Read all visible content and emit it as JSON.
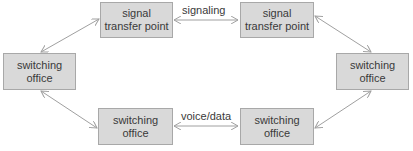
{
  "diagram": {
    "nodes": [
      {
        "id": "stp_left",
        "line1": "signal",
        "line2": "transfer point"
      },
      {
        "id": "stp_right",
        "line1": "signal",
        "line2": "transfer point"
      },
      {
        "id": "so_left",
        "line1": "switching",
        "line2": "office"
      },
      {
        "id": "so_right",
        "line1": "switching",
        "line2": "office"
      },
      {
        "id": "so_bottom_left",
        "line1": "switching",
        "line2": "office"
      },
      {
        "id": "so_bottom_right",
        "line1": "switching",
        "line2": "office"
      }
    ],
    "edges": [
      {
        "from": "stp_left",
        "to": "stp_right",
        "label": "signaling",
        "direction": "both"
      },
      {
        "from": "so_bottom_left",
        "to": "so_bottom_right",
        "label": "voice/data",
        "direction": "both"
      },
      {
        "from": "stp_left",
        "to": "so_left",
        "label": "",
        "direction": "both"
      },
      {
        "from": "stp_right",
        "to": "so_right",
        "label": "",
        "direction": "both"
      },
      {
        "from": "so_left",
        "to": "so_bottom_left",
        "label": "",
        "direction": "both"
      },
      {
        "from": "so_right",
        "to": "so_bottom_right",
        "label": "",
        "direction": "both"
      }
    ],
    "colors": {
      "box_fill": "#d9d9d9",
      "box_border": "#a8a8a8",
      "line": "#a0a0a0",
      "text": "#3a3a3a"
    }
  }
}
